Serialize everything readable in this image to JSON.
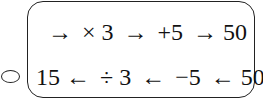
{
  "option": {
    "marker": "radio-circle"
  },
  "diagram": {
    "top_row": {
      "tokens": [
        "→",
        "× 3",
        "→",
        "+5",
        "→",
        "50"
      ]
    },
    "bottom_row": {
      "tokens": [
        "15",
        "←",
        "÷ 3",
        "←",
        "−5",
        "←",
        "50"
      ]
    }
  }
}
